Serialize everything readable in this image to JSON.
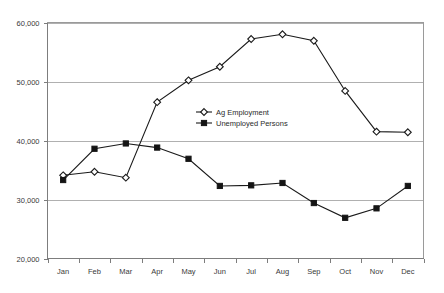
{
  "chart_data": {
    "type": "line",
    "title": "",
    "subtitle": "",
    "xlabel": "",
    "ylabel": "",
    "categories": [
      "Jan",
      "Feb",
      "Mar",
      "Apr",
      "May",
      "Jun",
      "Jul",
      "Aug",
      "Sep",
      "Oct",
      "Nov",
      "Dec"
    ],
    "ylim": [
      20000,
      60000
    ],
    "ytick_values": [
      20000,
      30000,
      40000,
      50000,
      60000
    ],
    "ytick_labels": [
      "20,000",
      "30,000",
      "40,000",
      "50,000",
      "60,000"
    ],
    "grid": true,
    "legend_position": "inside-center-left",
    "series": [
      {
        "name": "Ag Employment",
        "marker": "open-diamond",
        "color": "#1a1a1a",
        "values": [
          34100,
          34700,
          33700,
          46500,
          50200,
          52500,
          57200,
          58000,
          56900,
          48400,
          41500,
          41400
        ]
      },
      {
        "name": "Unemployed Persons",
        "marker": "filled-square",
        "color": "#141414",
        "values": [
          33300,
          38600,
          39500,
          38800,
          36900,
          32300,
          32400,
          32800,
          29400,
          26900,
          28500,
          32300
        ]
      }
    ]
  },
  "legend": {
    "items": [
      {
        "label": "Ag Employment",
        "marker": "open-diamond"
      },
      {
        "label": "Unemployed Persons",
        "marker": "filled-square"
      }
    ]
  },
  "colors": {
    "background": "#ffffff",
    "gridline": "#b0b0b0",
    "border": "#9a9a9a",
    "axis": "#7d7d7d",
    "series_ag": "#1a1a1a",
    "series_unemployed": "#141414",
    "text": "#3a3a3a"
  }
}
